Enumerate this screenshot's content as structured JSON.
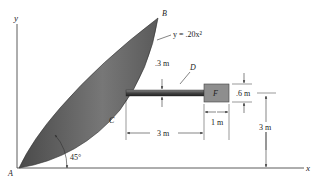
{
  "figure": {
    "axes": {
      "x_label": "x",
      "y_label": "y"
    },
    "points": {
      "A": "A",
      "B": "B",
      "C": "C",
      "D": "D",
      "F": "F"
    },
    "curve_equation": "y = .20x²",
    "angle_label": "45°",
    "dimensions": {
      "rod_diameter": ".3 m",
      "block_height": ".6 m",
      "rod_length": "3 m",
      "block_width": "1 m",
      "height_to_rod": "3 m"
    },
    "colors": {
      "shape_fill": "#6a6a6a",
      "shape_dark": "#3a3a3a",
      "rod": "#555555",
      "block": "#8a8a8a",
      "line": "#333333"
    }
  }
}
